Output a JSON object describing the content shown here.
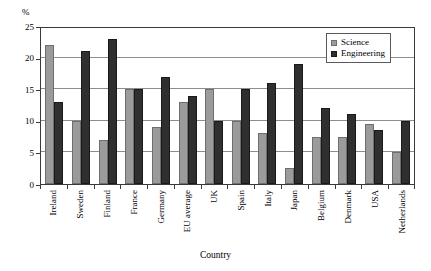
{
  "chart_data": {
    "type": "bar",
    "title": "",
    "xlabel": "Country",
    "ylabel": "%",
    "ylim": [
      0,
      25
    ],
    "yticks": [
      0,
      5,
      10,
      15,
      20,
      25
    ],
    "grid": true,
    "legend_position": "top-right",
    "categories": [
      "Ireland",
      "Sweden",
      "Finland",
      "France",
      "Germany",
      "EU average",
      "UK",
      "Spain",
      "Italy",
      "Japan",
      "Belgium",
      "Denmark",
      "USA",
      "Netherlands"
    ],
    "series": [
      {
        "name": "Science",
        "color": "#9b9b9b",
        "values": [
          22,
          10,
          7,
          15,
          9,
          13,
          15,
          10,
          8,
          2.5,
          7.5,
          7.5,
          9.5,
          5
        ]
      },
      {
        "name": "Engineering",
        "color": "#2f2f2f",
        "values": [
          13,
          21,
          23,
          15,
          17,
          14,
          10,
          15,
          16,
          19,
          12,
          11,
          8.5,
          10
        ]
      }
    ]
  },
  "axis": {
    "y_unit_label": "%",
    "x_title": "Country"
  },
  "legend": {
    "items": [
      {
        "label": "Science",
        "swatch": "#9b9b9b"
      },
      {
        "label": "Engineering",
        "swatch": "#2f2f2f"
      }
    ]
  }
}
